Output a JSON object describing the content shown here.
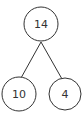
{
  "diagram": {
    "type": "number-bond",
    "whole": {
      "value": "14"
    },
    "parts": [
      {
        "value": "10"
      },
      {
        "value": "4"
      }
    ]
  },
  "colors": {
    "stroke": "#333333",
    "background": "#ffffff"
  }
}
